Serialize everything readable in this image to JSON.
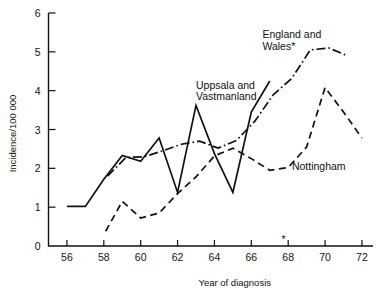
{
  "chart_data": {
    "type": "line",
    "title": "",
    "xlabel": "Year of diagnosis",
    "ylabel": "Incidence/100 000",
    "xlim": [
      55,
      72.6
    ],
    "ylim": [
      0,
      6
    ],
    "grid": false,
    "legend_position": "inline-annotations",
    "x_ticks": [
      56,
      58,
      60,
      62,
      64,
      66,
      68,
      70,
      72
    ],
    "x_tick_labels": [
      "56",
      "58",
      "60",
      "62",
      "64",
      "66",
      "68",
      "70",
      "72"
    ],
    "y_ticks": [
      0,
      1,
      2,
      3,
      4,
      5,
      6
    ],
    "y_tick_labels": [
      "0",
      "1",
      "2",
      "3",
      "4",
      "5",
      "6"
    ],
    "annotations": [
      {
        "name": "uppsala-label",
        "text": "Uppsala and\nVastmanland",
        "line1": "Uppsala and",
        "line2": "Vastmanland",
        "x": 63.0,
        "y": 4.05
      },
      {
        "name": "england-wales-label",
        "text": "England and\nWales*",
        "line1": "England and",
        "line2": "Wales*",
        "x": 66.6,
        "y": 5.35
      },
      {
        "name": "nottingham-label",
        "text": "Nottingham",
        "x": 68.2,
        "y": 1.95
      },
      {
        "name": "axis-asterisk",
        "text": "*",
        "x": 67.75,
        "y": 0.0
      }
    ],
    "series": [
      {
        "name": "Uppsala and Vastmanland",
        "style": "solid",
        "x": [
          56,
          57,
          58,
          59,
          60,
          61,
          62,
          63,
          64,
          65,
          66,
          67
        ],
        "values": [
          1.02,
          1.02,
          1.72,
          2.33,
          2.18,
          2.78,
          1.38,
          3.62,
          2.38,
          1.38,
          3.45,
          4.25
        ]
      },
      {
        "name": "England and Wales",
        "style": "dash-dot",
        "x": [
          58.2,
          59.2,
          60.2,
          61.2,
          62.2,
          63.2,
          64.2,
          65.2,
          66.2,
          67.2,
          68.2,
          69.2,
          70.2,
          71.2
        ],
        "values": [
          1.8,
          2.28,
          2.3,
          2.45,
          2.62,
          2.7,
          2.52,
          2.72,
          3.22,
          3.9,
          4.32,
          5.05,
          5.1,
          4.9
        ]
      },
      {
        "name": "Nottingham",
        "style": "dashed",
        "x": [
          58.1,
          59.0,
          60.0,
          61.0,
          62.0,
          63.0,
          64.0,
          65.0,
          66.0,
          67.0,
          68.0,
          69.0,
          70.0,
          71.0,
          72.0
        ],
        "values": [
          0.38,
          1.15,
          0.72,
          0.85,
          1.35,
          1.78,
          2.32,
          2.52,
          2.25,
          1.95,
          2.02,
          2.55,
          4.08,
          3.45,
          2.78
        ]
      }
    ]
  }
}
